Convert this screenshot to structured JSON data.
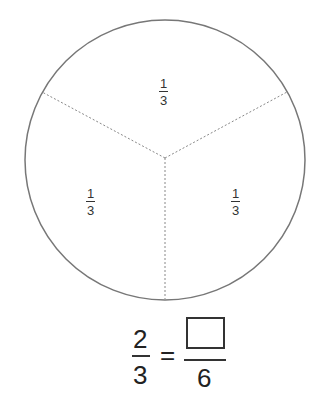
{
  "diagram": {
    "title": "",
    "circle": {
      "cx": 165,
      "cy": 160,
      "r": 140,
      "stroke": "#777777"
    },
    "dividers": [
      {
        "x2": 42,
        "y2": 92
      },
      {
        "x2": 287,
        "y2": 92
      },
      {
        "x2": 165,
        "y2": 299
      }
    ],
    "sections": [
      {
        "label_num": "1",
        "label_den": "3"
      },
      {
        "label_num": "1",
        "label_den": "3"
      },
      {
        "label_num": "1",
        "label_den": "3"
      }
    ]
  },
  "equation": {
    "left_num": "2",
    "left_den": "3",
    "equals": "=",
    "right_num": "",
    "right_den": "6"
  }
}
